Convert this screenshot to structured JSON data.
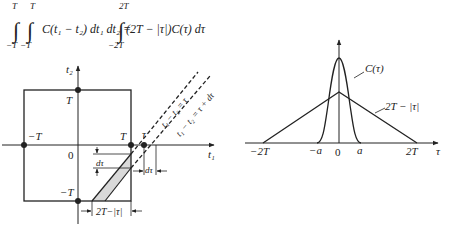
{
  "equation": {
    "lhs_int_upper_1": "T",
    "lhs_int_upper_2": "T",
    "lhs_int_lower_1": "−T",
    "lhs_int_lower_2": "−T",
    "lhs_integrand": "C(t₁ − t₂) dt₁ dt₂ =",
    "rhs_int_upper": "2T",
    "rhs_int_lower": "−2T",
    "rhs_integrand": "(2T − |τ|)C(τ) dτ"
  },
  "left_diagram": {
    "y_axis_label": "t₂",
    "x_axis_label": "t₁",
    "label_T_top": "T",
    "label_negT_left": "−T",
    "label_T_right": "T",
    "label_tau": "τ",
    "label_zero": "0",
    "label_negT_bottom": "−T",
    "line1_label": "t₁ − t₂ = τ",
    "line2_label": "t₁ − t₂ = τ + dτ",
    "dtau_vertical": "dτ",
    "dtau_horizontal": "dτ",
    "width_label": "2T−|τ|"
  },
  "right_diagram": {
    "curve_label": "C(τ)",
    "triangle_label": "2T − |τ|",
    "x_axis_label": "τ",
    "ticks": [
      "−2T",
      "−a",
      "0",
      "a",
      "2T"
    ]
  },
  "colors": {
    "stroke": "#222222",
    "shade": "#d9d9d9"
  }
}
